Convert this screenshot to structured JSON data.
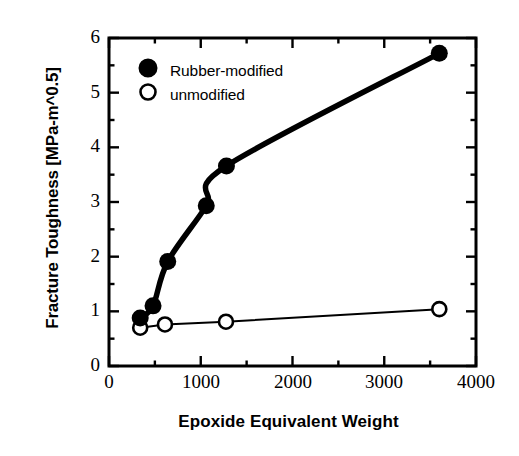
{
  "chart_data": {
    "type": "scatter",
    "title": "",
    "xlabel": "Epoxide Equivalent Weight",
    "ylabel": "Fracture Toughness [MPa-m^0.5]",
    "xlim": [
      0,
      4000
    ],
    "ylim": [
      0,
      6
    ],
    "xticks": [
      0,
      1000,
      2000,
      3000,
      4000
    ],
    "yticks": [
      0,
      1,
      2,
      3,
      4,
      5,
      6
    ],
    "xtick_labels": [
      "0",
      "1000",
      "2000",
      "3000",
      "4000"
    ],
    "ytick_labels": [
      "0",
      "1",
      "2",
      "3",
      "4",
      "5",
      "6"
    ],
    "x_minor_tick_interval": 500,
    "y_minor_tick_interval": 0.5,
    "grid": false,
    "legend_position": "upper-left-inside",
    "series": [
      {
        "name": "Rubber-modified",
        "marker": "filled-circle",
        "marker_color": "#000000",
        "line_width_px": 5,
        "x": [
          340,
          480,
          640,
          1060,
          1280,
          3600
        ],
        "y": [
          0.88,
          1.1,
          1.91,
          2.93,
          3.66,
          5.72
        ]
      },
      {
        "name": "unmodified",
        "marker": "open-circle",
        "marker_color": "#ffffff",
        "line_width_px": 2,
        "x": [
          340,
          610,
          1275,
          3600
        ],
        "y": [
          0.7,
          0.76,
          0.81,
          1.04
        ]
      }
    ]
  },
  "legend": {
    "entries": [
      {
        "label": "Rubber-modified",
        "marker": "filled-circle"
      },
      {
        "label": "unmodified",
        "marker": "open-circle"
      }
    ]
  },
  "colors": {
    "axis": "#000000",
    "line": "#000000",
    "background": "#ffffff"
  }
}
